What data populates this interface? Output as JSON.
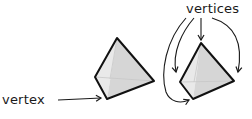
{
  "labels": {
    "single": "vertex",
    "plural": "vertices"
  },
  "shapes": [
    {
      "name": "tetrahedron-left",
      "fill": "#e3e3e3",
      "stroke": "#111111"
    },
    {
      "name": "tetrahedron-right",
      "fill": "#e3e3e3",
      "stroke": "#111111"
    }
  ],
  "colors": {
    "stroke": "#111111",
    "face_light": "#ececec",
    "face_dark": "#d2d2d2",
    "hidden_edge": "#c4c4c4"
  }
}
